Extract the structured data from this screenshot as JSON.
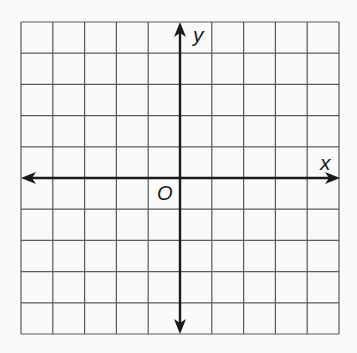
{
  "diagram": {
    "type": "coordinate-plane",
    "grid": {
      "cols": 10,
      "rows": 10,
      "left": 21,
      "top": 22,
      "right": 339,
      "bottom": 334,
      "line_color": "#555555"
    },
    "axes": {
      "origin_px": [
        180,
        178
      ],
      "color": "#1a1a1a"
    },
    "labels": {
      "x_axis": "x",
      "y_axis": "y",
      "origin": "O"
    }
  }
}
